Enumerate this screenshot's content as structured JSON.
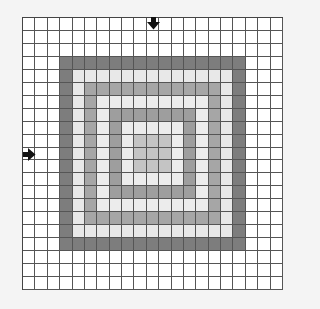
{
  "grid": {
    "rows": 21,
    "cols": 21,
    "center": {
      "row": 10,
      "col": 10
    },
    "ring_colors": {
      "0": "#ffffff",
      "1": "#ffffff",
      "2": "#ffffff",
      "3": "#7d7d7d",
      "4": "#e8e8e8",
      "5": "#a6a6a6",
      "6": "#ececec",
      "7": "#9e9e9e",
      "8": "#ececec",
      "9": "#c4c4c4",
      "10": "#c4c4c4"
    },
    "line_color": "#555555"
  },
  "markers": [
    {
      "name": "column-marker",
      "direction": "down",
      "col": 10,
      "row": 0,
      "color": "#111111"
    },
    {
      "name": "row-marker",
      "direction": "right",
      "col": 0,
      "row": 10,
      "color": "#111111"
    }
  ],
  "background": "#f4f4f4"
}
